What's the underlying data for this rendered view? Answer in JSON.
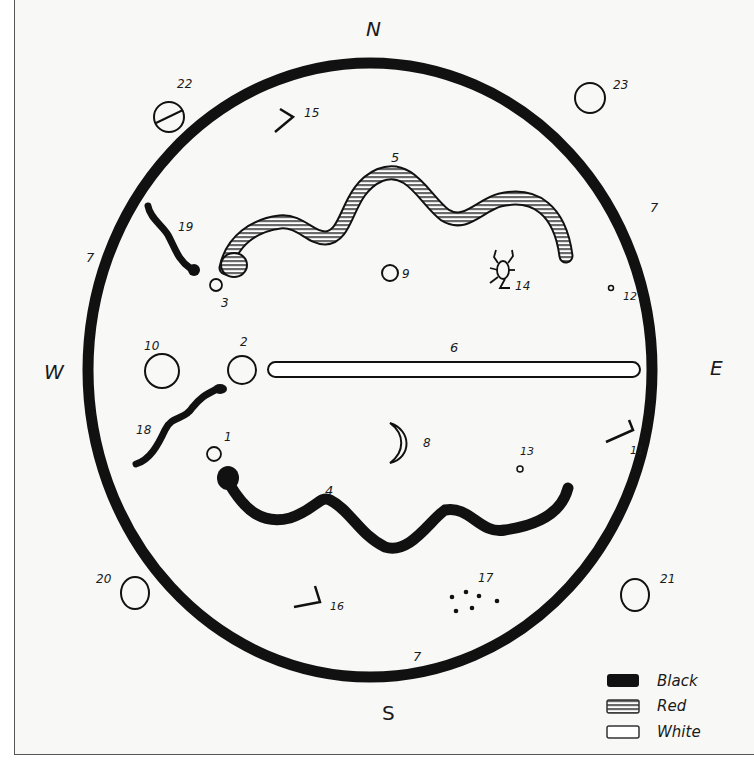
{
  "directions": {
    "north": "N",
    "south": "S",
    "east": "E",
    "west": "W"
  },
  "colors": {
    "black": "#111111",
    "red_hatch": "#777777",
    "white": "#ffffff",
    "paper": "#f8f8f6"
  },
  "labels": {
    "l1": "1",
    "l2": "2",
    "l3": "3",
    "l4": "4",
    "l5": "5",
    "l6": "6",
    "l7_left": "7",
    "l7_right": "7",
    "l7_bottom": "7",
    "l8": "8",
    "l9": "9",
    "l10": "10",
    "l11": "11",
    "l12": "12",
    "l13": "13",
    "l14": "14",
    "l15": "15",
    "l16": "16",
    "l17": "17",
    "l18": "18",
    "l19": "19",
    "l20": "20",
    "l21": "21",
    "l22": "22",
    "l23": "23"
  },
  "legend": {
    "items": [
      {
        "label": "Black",
        "swatch": "black"
      },
      {
        "label": "Red",
        "swatch": "red"
      },
      {
        "label": "White",
        "swatch": "white"
      }
    ]
  },
  "symbols": [
    {
      "id": "1",
      "type": "small-circle"
    },
    {
      "id": "2",
      "type": "circle"
    },
    {
      "id": "3",
      "type": "small-circle"
    },
    {
      "id": "4",
      "type": "snake",
      "color": "black"
    },
    {
      "id": "5",
      "type": "snake",
      "color": "red"
    },
    {
      "id": "6",
      "type": "bar",
      "color": "white"
    },
    {
      "id": "7",
      "type": "ring",
      "color": "black"
    },
    {
      "id": "8",
      "type": "crescent"
    },
    {
      "id": "9",
      "type": "circle"
    },
    {
      "id": "10",
      "type": "circle"
    },
    {
      "id": "11",
      "type": "angle-mark"
    },
    {
      "id": "12",
      "type": "dot"
    },
    {
      "id": "13",
      "type": "dot"
    },
    {
      "id": "14",
      "type": "insect"
    },
    {
      "id": "15",
      "type": "angle-mark"
    },
    {
      "id": "16",
      "type": "angle-mark"
    },
    {
      "id": "17",
      "type": "dot-cluster"
    },
    {
      "id": "18",
      "type": "snake",
      "color": "black"
    },
    {
      "id": "19",
      "type": "snake",
      "color": "black"
    },
    {
      "id": "20",
      "type": "circle"
    },
    {
      "id": "21",
      "type": "circle"
    },
    {
      "id": "22",
      "type": "crossed-circle"
    },
    {
      "id": "23",
      "type": "circle"
    }
  ]
}
